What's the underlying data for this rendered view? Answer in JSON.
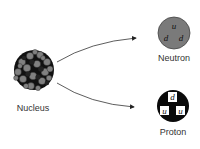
{
  "diagram": {
    "nucleus": {
      "label": "Nucleus",
      "colors": {
        "dark": "#111111",
        "light": "#808080"
      }
    },
    "neutron": {
      "label": "Neutron",
      "fill": "#7a7a7a",
      "quarks": [
        "u",
        "d",
        "d"
      ]
    },
    "proton": {
      "label": "Proton",
      "fill": "#0a0a0a",
      "quarks": [
        "d",
        "u",
        "u"
      ]
    },
    "arrows": [
      {
        "from": "nucleus",
        "to": "neutron"
      },
      {
        "from": "nucleus",
        "to": "proton"
      }
    ]
  }
}
